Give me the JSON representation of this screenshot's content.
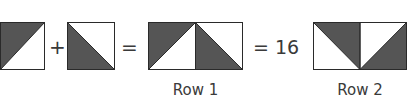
{
  "colors": {
    "fill_dark": "#555555",
    "fill_light": "#ffffff",
    "stroke": "#2a2a2a"
  },
  "equation": {
    "operator_plus": "+",
    "operator_equals": "=",
    "result_text": "= 16"
  },
  "tiles": [
    {
      "id": "tile-a",
      "shaded_triangle": "top-left"
    },
    {
      "id": "tile-b",
      "shaded_triangle": "bottom-left"
    }
  ],
  "rows": [
    {
      "label": "Row 1",
      "halves": [
        "top-left",
        "bottom-left"
      ]
    },
    {
      "label": "Row 2",
      "halves": [
        "top-right",
        "bottom-right"
      ]
    }
  ]
}
